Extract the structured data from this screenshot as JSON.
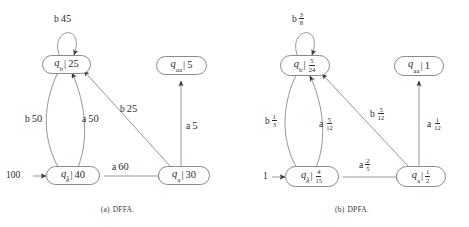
{
  "figures": [
    {
      "id": "dffa",
      "caption_index": "(a)",
      "caption_text": "DFFA.",
      "start_weight": "100",
      "states": [
        {
          "name": "q",
          "sub": "b",
          "value": "25"
        },
        {
          "name": "q",
          "sub": "aa",
          "value": "5"
        },
        {
          "name": "q",
          "sub": "λ",
          "value": "40"
        },
        {
          "name": "q",
          "sub": "a",
          "value": "30"
        }
      ],
      "edges": [
        {
          "symbol": "b",
          "weight": "45"
        },
        {
          "symbol": "b",
          "weight": "50"
        },
        {
          "symbol": "a",
          "weight": "50"
        },
        {
          "symbol": "b",
          "weight": "25"
        },
        {
          "symbol": "a",
          "weight": "5"
        },
        {
          "symbol": "a",
          "weight": "60"
        }
      ]
    },
    {
      "id": "dpfa",
      "caption_index": "(b)",
      "caption_text": "DPFA.",
      "start_weight": "1",
      "states": [
        {
          "name": "q",
          "sub": "b",
          "num": "5",
          "den": "24"
        },
        {
          "name": "q",
          "sub": "aa",
          "value": "1"
        },
        {
          "name": "q",
          "sub": "λ",
          "num": "4",
          "den": "15"
        },
        {
          "name": "q",
          "sub": "a",
          "num": "1",
          "den": "2"
        }
      ],
      "edges": [
        {
          "symbol": "b",
          "num": "3",
          "den": "8"
        },
        {
          "symbol": "b",
          "num": "1",
          "den": "3"
        },
        {
          "symbol": "a",
          "num": "5",
          "den": "12"
        },
        {
          "symbol": "b",
          "num": "5",
          "den": "12"
        },
        {
          "symbol": "a",
          "num": "1",
          "den": "12"
        },
        {
          "symbol": "a",
          "num": "2",
          "den": "5"
        }
      ]
    }
  ],
  "colors": {
    "stroke": "#8a8a8a",
    "text": "#2b2b2b",
    "background": "#ffffff"
  }
}
